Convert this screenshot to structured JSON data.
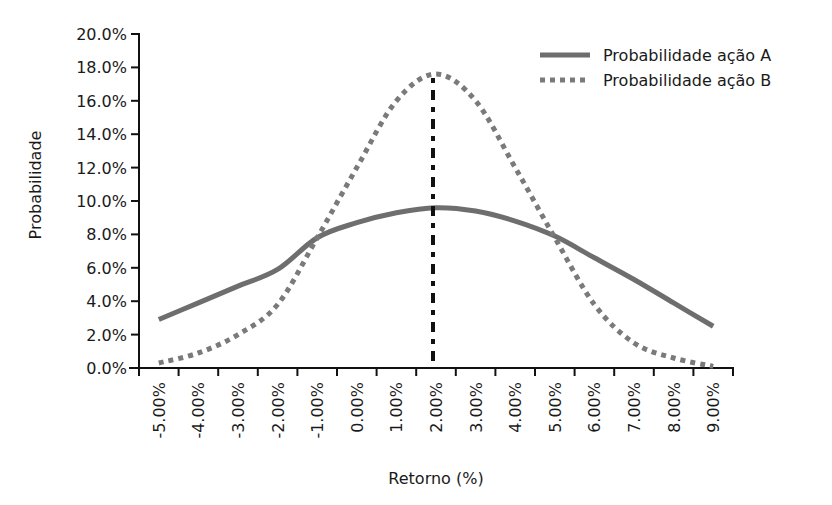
{
  "chart_data": {
    "type": "line",
    "title": "",
    "xlabel": "Retorno (%)",
    "ylabel": "Probabilidade",
    "categories": [
      "-5.00%",
      "-4.00%",
      "-3.00%",
      "-2.00%",
      "-1.00%",
      "0.00%",
      "1.00%",
      "2.00%",
      "3.00%",
      "4.00%",
      "5.00%",
      "6.00%",
      "7.00%",
      "8.00%",
      "9.00%"
    ],
    "x": [
      -5,
      -4,
      -3,
      -2,
      -1,
      0,
      1,
      2,
      3,
      4,
      5,
      6,
      7,
      8,
      9
    ],
    "series": [
      {
        "name": "Probabilidade ação A",
        "style": "solid",
        "color": "#6e6e6e",
        "values": [
          2.9,
          3.9,
          4.9,
          5.9,
          7.8,
          8.7,
          9.3,
          9.6,
          9.4,
          8.8,
          7.9,
          6.6,
          5.3,
          3.9,
          2.5
        ]
      },
      {
        "name": "Probabilidade ação B",
        "style": "dotted",
        "color": "#7a7a7a",
        "values": [
          0.3,
          0.9,
          2.0,
          3.8,
          7.8,
          12.0,
          16.0,
          17.6,
          16.0,
          12.0,
          7.8,
          3.8,
          1.5,
          0.6,
          0.1
        ]
      }
    ],
    "annotations": [
      {
        "type": "vertical-dash-dot-line",
        "x": 2,
        "color": "#111111",
        "label": ""
      }
    ],
    "y_ticks": [
      "0.0%",
      "2.0%",
      "4.0%",
      "6.0%",
      "8.0%",
      "10.0%",
      "12.0%",
      "14.0%",
      "16.0%",
      "18.0%",
      "20.0%"
    ],
    "ylim": [
      0,
      20
    ],
    "grid": false,
    "legend_position": "top-right"
  },
  "labels": {
    "xlabel": "Retorno (%)",
    "ylabel": "Probabilidade",
    "legend_a": "Probabilidade ação A",
    "legend_b": "Probabilidade ação B"
  }
}
